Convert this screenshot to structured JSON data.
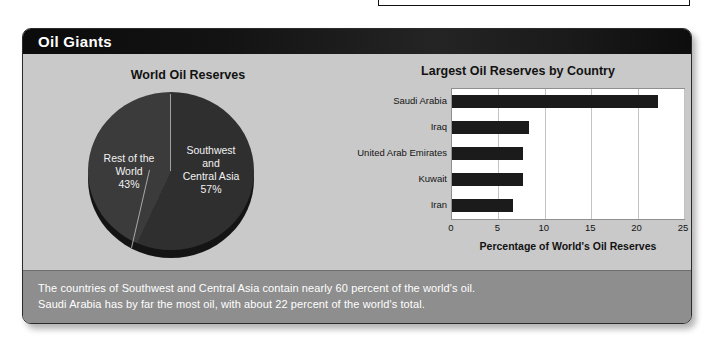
{
  "panel": {
    "title": "Oil Giants"
  },
  "pie_chart": {
    "title": "World Oil Reserves",
    "labels": {
      "rest_of_world": "Rest of the\nWorld\n43%",
      "rest_of_world_name": "Rest of the World",
      "rest_of_world_pct": "43%",
      "swca_name": "Southwest and Central Asia",
      "swca_pct": "57%"
    }
  },
  "bar_chart": {
    "title": "Largest Oil Reserves by Country",
    "x_axis_title": "Percentage of World's Oil Reserves"
  },
  "caption": {
    "line1": "The countries of Southwest and Central Asia contain nearly 60 percent of the world's oil.",
    "line2": "Saudi Arabia has by far the most oil, with about 22 percent of the world's total."
  },
  "colors": {
    "panel_background": "#c9c9c9",
    "title_bar": "#121212",
    "caption_band": "#8e8e8e",
    "bar_fill": "#1b1b1b",
    "pie_slice_swca": "#2f2f2f",
    "pie_slice_rest": "#3b3b3b",
    "plot_background": "#ffffff",
    "gridline": "#c3c3c3"
  },
  "chart_data": [
    {
      "type": "pie",
      "title": "World Oil Reserves",
      "categories": [
        "Southwest and Central Asia",
        "Rest of the World"
      ],
      "values": [
        57,
        43
      ],
      "value_unit": "percent",
      "labels": [
        "Southwest\nand\nCentral Asia\n57%",
        "Rest of the\nWorld\n43%"
      ],
      "legend": "none",
      "slice_colors": [
        "#2f2f2f",
        "#3b3b3b"
      ],
      "three_d": true
    },
    {
      "type": "bar",
      "orientation": "horizontal",
      "title": "Largest Oil Reserves by Country",
      "categories": [
        "Saudi Arabia",
        "Iraq",
        "United Arab Emirates",
        "Kuwait",
        "Iran"
      ],
      "values": [
        22.2,
        8.3,
        7.6,
        7.6,
        6.6
      ],
      "xlabel": "Percentage of World's Oil Reserves",
      "ylabel": "",
      "xlim": [
        0,
        25
      ],
      "xticks": [
        0,
        5,
        10,
        15,
        20,
        25
      ],
      "grid": "vertical",
      "legend": "none",
      "bar_color": "#1b1b1b"
    }
  ]
}
